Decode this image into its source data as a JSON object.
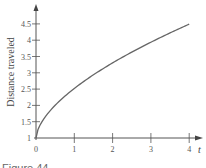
{
  "chart_data": {
    "type": "line",
    "title": "",
    "xlabel": "t",
    "ylabel": "Distance traveled",
    "xlim": [
      0,
      4.2
    ],
    "ylim": [
      1,
      4.8
    ],
    "x_ticks": [
      "0",
      "1",
      "2",
      "3",
      "4"
    ],
    "y_ticks": [
      "1",
      "1.5",
      "2",
      "2.5",
      "3",
      "3.5",
      "4",
      "4.5"
    ],
    "grid": false,
    "legend": null,
    "series": [
      {
        "name": "distance",
        "x": [
          0,
          0.25,
          0.5,
          0.75,
          1,
          1.5,
          2,
          2.5,
          3,
          3.5,
          4
        ],
        "y": [
          1.0,
          1.66,
          2.0,
          2.28,
          2.52,
          2.94,
          3.3,
          3.64,
          3.95,
          4.23,
          4.5
        ]
      }
    ],
    "caption": "Figure 44"
  }
}
